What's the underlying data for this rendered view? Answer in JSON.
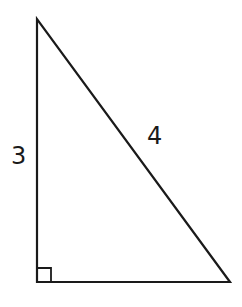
{
  "diagram": {
    "type": "right-triangle",
    "stroke_color": "#1a1a1a",
    "background": "#ffffff",
    "vertices": {
      "top": [
        37,
        19
      ],
      "bottom_left": [
        37,
        282
      ],
      "bottom_right": [
        230,
        282
      ]
    },
    "right_angle_marker": {
      "corner": "bottom_left",
      "size": 14
    },
    "labels": {
      "vertical_side": "3",
      "hypotenuse": "4"
    }
  }
}
